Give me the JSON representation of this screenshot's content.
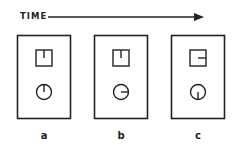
{
  "timeline": {
    "label": "TIME",
    "direction": "left-to-right"
  },
  "frames": [
    {
      "label": "a",
      "square_indicator": "tick from top center (pointing down)",
      "circle_indicator": "hand pointing to 12 o'clock"
    },
    {
      "label": "b",
      "square_indicator": "tick from top center (pointing down)",
      "circle_indicator": "hand pointing to 3 o'clock"
    },
    {
      "label": "c",
      "square_indicator": "tick from right side center (pointing left)",
      "circle_indicator": "hand pointing to 6 o'clock"
    }
  ],
  "colors": {
    "stroke": "#222222",
    "background": "#ffffff"
  }
}
